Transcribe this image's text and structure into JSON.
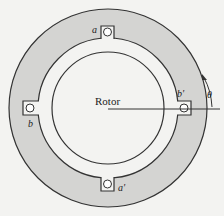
{
  "diagram": {
    "rotor_label": "Rotor",
    "slots": [
      {
        "label": "a",
        "position": "top"
      },
      {
        "label": "b",
        "position": "left"
      },
      {
        "label": "b'",
        "position": "right"
      },
      {
        "label": "a'",
        "position": "bottom"
      }
    ],
    "angle_label": "θ",
    "colors": {
      "stator": "#d4d4d2",
      "line": "#333333",
      "background": "#f3f3f1"
    }
  }
}
